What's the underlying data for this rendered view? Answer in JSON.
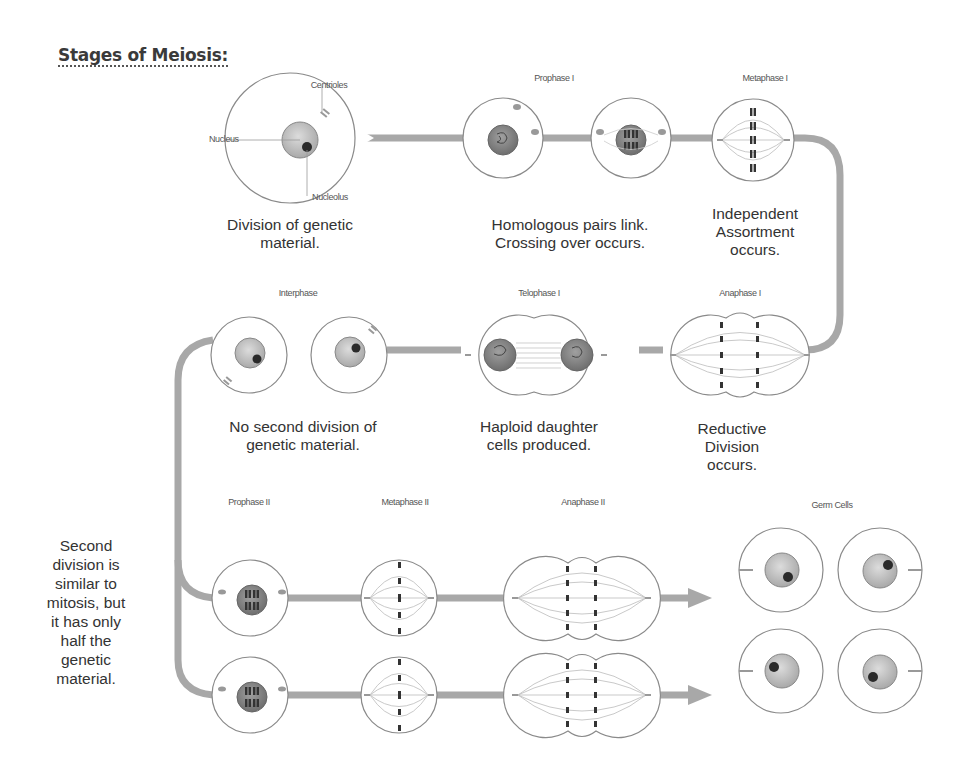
{
  "title": "Stages of Meiosis:",
  "row1": {
    "first_cell_labels": {
      "centrioles": "Centrioles",
      "nucleus": "Nucleus",
      "nucleolus": "Nucleolus"
    },
    "stages": [
      {
        "name": "Prophase I"
      },
      {
        "name": "Metaphase I"
      }
    ],
    "descriptions": [
      {
        "lines": [
          "Division of genetic",
          "material."
        ]
      },
      {
        "lines": [
          "Homologous pairs link.",
          "Crossing over occurs."
        ]
      },
      {
        "lines": [
          "Independent",
          "Assortment",
          "occurs."
        ]
      }
    ]
  },
  "row2": {
    "stages": [
      {
        "name": "Interphase"
      },
      {
        "name": "Telophase I"
      },
      {
        "name": "Anaphase I"
      }
    ],
    "descriptions": [
      {
        "lines": [
          "No second division of",
          "genetic material."
        ]
      },
      {
        "lines": [
          "Haploid daughter",
          "cells produced."
        ]
      },
      {
        "lines": [
          "Reductive",
          "Division",
          "occurs."
        ]
      }
    ]
  },
  "row3": {
    "stages": [
      {
        "name": "Prophase II"
      },
      {
        "name": "Metaphase II"
      },
      {
        "name": "Anaphase II"
      },
      {
        "name": "Germ Cells"
      }
    ]
  },
  "side_note": {
    "lines": [
      "Second",
      "division is",
      "similar to",
      "mitosis, but",
      "it has only",
      "half the",
      "genetic",
      "material."
    ]
  },
  "colors": {
    "pathway": "#a8a8a8",
    "cell_outline": "#8a8a8a",
    "nucleus_fill": "#c4c4c4",
    "nucleolus_fill": "#2a2a2a",
    "text": "#333333"
  }
}
